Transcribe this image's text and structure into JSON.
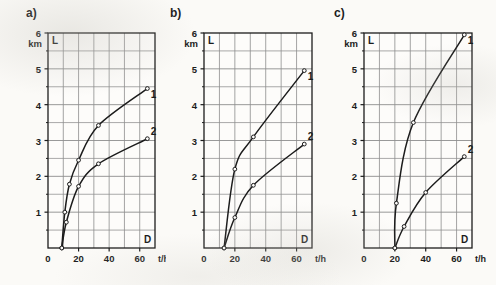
{
  "figure": {
    "background_color": "#fbfaf7",
    "ink_color": "#1c1c1c",
    "grid_color": "#8d8d8d",
    "panels": [
      {
        "tag": "a)",
        "y_axis": {
          "label": "L",
          "unit": "km",
          "top_value": "6",
          "ticks": [
            "6",
            "5",
            "4",
            "3",
            "2",
            "1"
          ]
        },
        "x_axis": {
          "label": "D",
          "unit": "t/h",
          "ticks": [
            "0",
            "20",
            "40",
            "60"
          ]
        }
      },
      {
        "tag": "b)",
        "y_axis": {
          "label": "L",
          "unit": "km",
          "top_value": "6",
          "ticks": [
            "6",
            "5",
            "4",
            "3",
            "2",
            "1"
          ]
        },
        "x_axis": {
          "label": "D",
          "unit": "t/h",
          "ticks": [
            "0",
            "20",
            "40",
            "60"
          ]
        }
      },
      {
        "tag": "c)",
        "y_axis": {
          "label": "L",
          "unit": "km",
          "top_value": "6",
          "ticks": [
            "6",
            "5",
            "4",
            "3",
            "2",
            "1"
          ]
        },
        "x_axis": {
          "label": "D",
          "unit": "t/h",
          "ticks": [
            "0",
            "20",
            "40",
            "60"
          ]
        }
      }
    ],
    "curve_labels": [
      "1",
      "2"
    ]
  },
  "chart_data": [
    {
      "type": "line",
      "panel": "a)",
      "title": "",
      "xlabel": "D",
      "xunit": "t/h",
      "ylabel": "L",
      "yunit": "km",
      "xlim": [
        0,
        70
      ],
      "ylim": [
        0,
        6
      ],
      "xticks": [
        0,
        20,
        40,
        60
      ],
      "yticks": [
        1,
        2,
        3,
        4,
        5,
        6
      ],
      "x_minor_step": 10,
      "y_minor_step": 0.5,
      "grid": true,
      "legend": "inline-end-labels",
      "series": [
        {
          "name": "1",
          "x": [
            9,
            11,
            14,
            20,
            33,
            65
          ],
          "y": [
            0,
            1.0,
            1.78,
            2.45,
            3.42,
            4.45
          ]
        },
        {
          "name": "2",
          "x": [
            9,
            12,
            20,
            33,
            65
          ],
          "y": [
            0,
            0.72,
            1.72,
            2.35,
            3.05
          ]
        }
      ]
    },
    {
      "type": "line",
      "panel": "b)",
      "title": "",
      "xlabel": "D",
      "xunit": "t/h",
      "ylabel": "L",
      "yunit": "km",
      "xlim": [
        0,
        70
      ],
      "ylim": [
        0,
        6
      ],
      "xticks": [
        0,
        20,
        40,
        60
      ],
      "yticks": [
        1,
        2,
        3,
        4,
        5,
        6
      ],
      "x_minor_step": 10,
      "y_minor_step": 0.5,
      "grid": true,
      "legend": "inline-end-labels",
      "series": [
        {
          "name": "1",
          "x": [
            13,
            20,
            32,
            65
          ],
          "y": [
            0,
            2.2,
            3.1,
            4.95
          ]
        },
        {
          "name": "2",
          "x": [
            13,
            20,
            32,
            65
          ],
          "y": [
            0,
            0.85,
            1.75,
            2.9
          ]
        }
      ]
    },
    {
      "type": "line",
      "panel": "c)",
      "title": "",
      "xlabel": "D",
      "xunit": "t/h",
      "ylabel": "L",
      "yunit": "km",
      "xlim": [
        0,
        70
      ],
      "ylim": [
        0,
        6
      ],
      "xticks": [
        0,
        20,
        40,
        60
      ],
      "yticks": [
        1,
        2,
        3,
        4,
        5,
        6
      ],
      "x_minor_step": 10,
      "y_minor_step": 0.5,
      "grid": true,
      "legend": "inline-end-labels",
      "series": [
        {
          "name": "1",
          "x": [
            20,
            21,
            32,
            65
          ],
          "y": [
            0,
            1.25,
            3.5,
            5.95
          ]
        },
        {
          "name": "2",
          "x": [
            20,
            26,
            40,
            65
          ],
          "y": [
            0,
            0.6,
            1.55,
            2.55
          ]
        }
      ]
    }
  ]
}
